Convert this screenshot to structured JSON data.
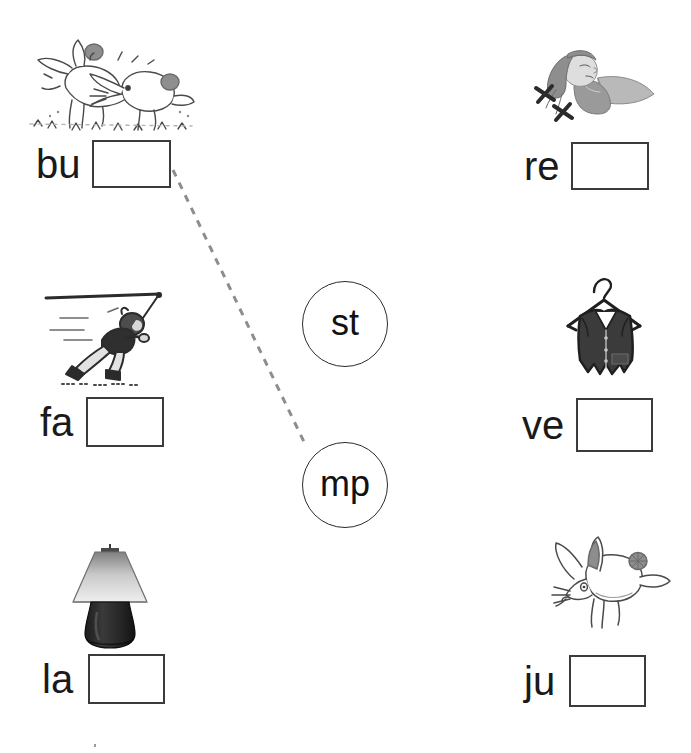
{
  "worksheet": {
    "title": "Blend worksheet: match picture to blend",
    "blend_circles": [
      {
        "id": "blend-st",
        "label": "st",
        "cx": 345,
        "cy": 324,
        "r": 43
      },
      {
        "id": "blend-mp",
        "label": "mp",
        "cx": 345,
        "cy": 485,
        "r": 43
      }
    ],
    "items": [
      {
        "id": "item-bu",
        "prefix": "bu",
        "icon": "two-rabbits-bumping-illustration",
        "answer": "",
        "answer_placeholder": "",
        "column": "left",
        "row": 1
      },
      {
        "id": "item-re",
        "prefix": "re",
        "icon": "girl-resting-sleeping-illustration",
        "answer": "",
        "answer_placeholder": "",
        "column": "right",
        "row": 1
      },
      {
        "id": "item-fa",
        "prefix": "fa",
        "icon": "person-running-fast-illustration",
        "answer": "",
        "answer_placeholder": "",
        "column": "left",
        "row": 2
      },
      {
        "id": "item-ve",
        "prefix": "ve",
        "icon": "vest-on-hanger-illustration",
        "answer": "",
        "answer_placeholder": "",
        "column": "right",
        "row": 2
      },
      {
        "id": "item-la",
        "prefix": "la",
        "icon": "table-lamp-illustration",
        "answer": "",
        "answer_placeholder": "",
        "column": "left",
        "row": 3
      },
      {
        "id": "item-ju",
        "prefix": "ju",
        "icon": "rabbit-jumping-illustration",
        "answer": "",
        "answer_placeholder": "",
        "column": "right",
        "row": 3
      }
    ],
    "connections": [
      {
        "id": "connection-bu-mp",
        "from": "item-bu",
        "to": "blend-mp",
        "x1": 173,
        "y1": 170,
        "x2": 306,
        "y2": 446,
        "style": "dashed",
        "color": "#8d8d8d"
      }
    ],
    "colors": {
      "page_background": "#ffffff",
      "text": "#1a1a1a",
      "box_border": "#3b3b3b",
      "circle_border": "#2b2b2b",
      "connection_line": "#8d8d8d"
    }
  }
}
